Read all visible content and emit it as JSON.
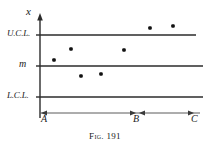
{
  "figure": {
    "caption_prefix": "Fig.",
    "caption_number": "191",
    "caption_full": "Fig. 191",
    "background_color": "#ffffff",
    "ink_color": "#1a1a1a"
  },
  "axes": {
    "y_axis_label": "x",
    "y_axis_arrow": "up-arrow",
    "x_axis_label": "",
    "origin_label": "A"
  },
  "control_lines": [
    {
      "name": "upper-control-limit",
      "label": "U.C.L.",
      "y": 35
    },
    {
      "name": "center-line",
      "label": "m",
      "y": 66
    },
    {
      "name": "lower-control-limit",
      "label": "L.C.L.",
      "y": 97
    }
  ],
  "interval_markers": [
    {
      "name": "interval-a",
      "label": "A",
      "x": 40
    },
    {
      "name": "interval-b",
      "label": "B",
      "x": 137
    },
    {
      "name": "interval-c",
      "label": "C",
      "x": 194
    }
  ],
  "chart_data": {
    "type": "scatter",
    "title": "Fig. 191",
    "xlabel": "",
    "ylabel": "x",
    "grid": false,
    "legend": null,
    "x_tick_labels": [
      "A",
      "B",
      "C"
    ],
    "x_tick_positions": [
      40,
      137,
      194
    ],
    "y_tick_labels": [
      "U.C.L.",
      "m",
      "L.C.L."
    ],
    "y_tick_positions": [
      35,
      66,
      97
    ],
    "xlim": [
      40,
      200
    ],
    "ylim": [
      113,
      14
    ],
    "reference_lines": [
      {
        "label": "U.C.L.",
        "y_px": 35,
        "x_start": 40,
        "x_end": 196
      },
      {
        "label": "m",
        "y_px": 66,
        "x_start": 40,
        "x_end": 203
      },
      {
        "label": "L.C.L.",
        "y_px": 97,
        "x_start": 40,
        "x_end": 203
      }
    ],
    "points": [
      {
        "x_px": 54,
        "y_px": 60
      },
      {
        "x_px": 71,
        "y_px": 49
      },
      {
        "x_px": 81,
        "y_px": 76
      },
      {
        "x_px": 101,
        "y_px": 74
      },
      {
        "x_px": 124,
        "y_px": 50
      },
      {
        "x_px": 150,
        "y_px": 28
      },
      {
        "x_px": 173,
        "y_px": 26
      }
    ],
    "point_count": 7,
    "annotations": [
      {
        "name": "segment-a-to-b",
        "from": "A",
        "to": "B",
        "arrows": "both-ends"
      },
      {
        "name": "segment-b-to-c",
        "from": "B",
        "to": "C",
        "arrows": "both-ends"
      }
    ]
  }
}
